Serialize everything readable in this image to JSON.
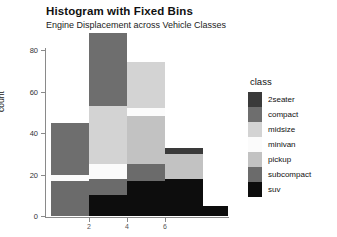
{
  "chart_data": {
    "type": "bar",
    "title": "Histogram with Fixed Bins",
    "subtitle": "Engine Displacement across Vehicle Classes",
    "xlabel": "",
    "ylabel": "count",
    "ylim": [
      0,
      85
    ],
    "yticks": [
      0,
      20,
      40,
      60,
      80
    ],
    "ytick_labels": [
      "0",
      "20",
      "40",
      "60",
      "80"
    ],
    "xticks": [
      2,
      4,
      6
    ],
    "xtick_labels": [
      "2",
      "4",
      "6"
    ],
    "grid": false,
    "legend_position": "right",
    "legend_title": "class",
    "stacked": true,
    "categories": [
      "bin1",
      "bin2",
      "bin3",
      "bin4",
      "bin5"
    ],
    "series": [
      {
        "name": "2seater",
        "color": "#3a3a3a",
        "values": [
          0,
          0,
          0,
          3,
          0
        ]
      },
      {
        "name": "compact",
        "color": "#6e6e6e",
        "values": [
          25,
          35,
          0,
          0,
          0
        ]
      },
      {
        "name": "midsize",
        "color": "#d3d3d3",
        "values": [
          0,
          28,
          22,
          0,
          0
        ]
      },
      {
        "name": "minivan",
        "color": "#fbfbfb",
        "values": [
          3,
          7,
          4,
          0,
          0
        ]
      },
      {
        "name": "pickup",
        "color": "#c2c2c2",
        "values": [
          0,
          0,
          23,
          12,
          0
        ]
      },
      {
        "name": "subcompact",
        "color": "#6b6b6b",
        "values": [
          17,
          8,
          8,
          0,
          0
        ]
      },
      {
        "name": "suv",
        "color": "#0d0d0d",
        "values": [
          0,
          10,
          17,
          18,
          5
        ]
      }
    ]
  },
  "legend": {
    "title": "class",
    "items": [
      {
        "label": "2seater",
        "color": "#3a3a3a"
      },
      {
        "label": "compact",
        "color": "#6e6e6e"
      },
      {
        "label": "midsize",
        "color": "#d3d3d3"
      },
      {
        "label": "minivan",
        "color": "#fbfbfb"
      },
      {
        "label": "pickup",
        "color": "#c2c2c2"
      },
      {
        "label": "subcompact",
        "color": "#6b6b6b"
      },
      {
        "label": "suv",
        "color": "#0d0d0d"
      }
    ]
  },
  "axes": {
    "y_title": "count",
    "y_ticks": [
      "80",
      "60",
      "40",
      "20",
      "0"
    ],
    "x_ticks": [
      "2",
      "4",
      "6"
    ]
  },
  "header": {
    "title": "Histogram with Fixed Bins",
    "subtitle": "Engine Displacement across Vehicle Classes"
  }
}
